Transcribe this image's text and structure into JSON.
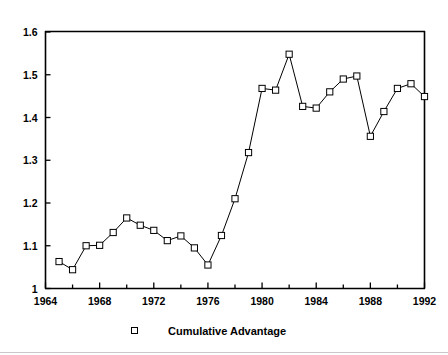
{
  "chart_data": {
    "type": "line",
    "title": "",
    "xlabel": "",
    "ylabel": "",
    "xlim": [
      1964,
      1992
    ],
    "ylim": [
      1.0,
      1.6
    ],
    "grid": false,
    "legend_position": "bottom-center",
    "marker": "open-square",
    "line_color": "#000000",
    "marker_face_color": "#ffffff",
    "y_ticks": [
      "1",
      "1.1",
      "1.2",
      "1.3",
      "1.4",
      "1.5",
      "1.6"
    ],
    "y_tick_values": [
      1.0,
      1.1,
      1.2,
      1.3,
      1.4,
      1.5,
      1.6
    ],
    "x_ticks": [
      "1964",
      "1968",
      "1972",
      "1976",
      "1980",
      "1984",
      "1988",
      "1992"
    ],
    "x_tick_values": [
      1964,
      1968,
      1972,
      1976,
      1980,
      1984,
      1988,
      1992
    ],
    "x_minor_tick_values": [
      1966,
      1970,
      1974,
      1978,
      1982,
      1986,
      1990
    ],
    "series": [
      {
        "name": "Cumulative Advantage",
        "x": [
          1965,
          1966,
          1967,
          1968,
          1969,
          1970,
          1971,
          1972,
          1973,
          1974,
          1975,
          1976,
          1977,
          1978,
          1979,
          1980,
          1981,
          1982,
          1983,
          1984,
          1985,
          1986,
          1987,
          1988,
          1989,
          1990,
          1991,
          1992
        ],
        "values": [
          1.063,
          1.044,
          1.1,
          1.101,
          1.131,
          1.165,
          1.148,
          1.136,
          1.112,
          1.123,
          1.095,
          1.055,
          1.124,
          1.21,
          1.318,
          1.468,
          1.464,
          1.548,
          1.426,
          1.422,
          1.46,
          1.49,
          1.497,
          1.356,
          1.414,
          1.468,
          1.479,
          1.449
        ]
      }
    ]
  },
  "legend": {
    "entries": [
      {
        "label": "Cumulative Advantage",
        "marker": "open-square"
      }
    ]
  }
}
